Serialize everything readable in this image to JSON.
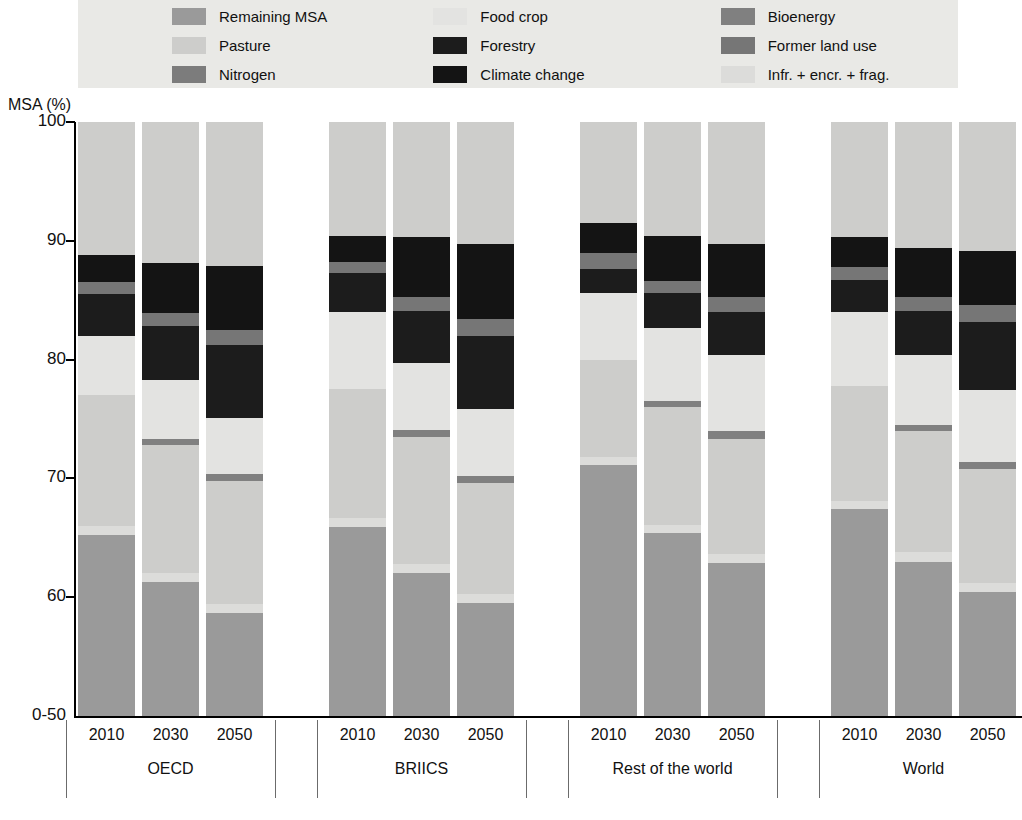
{
  "chart_data": {
    "type": "bar",
    "subtype": "stacked-bar-grouped",
    "title": "",
    "xlabel": "",
    "ylabel": "MSA (%)",
    "ylim": [
      50,
      100
    ],
    "yaxis_break_label": "0-50",
    "ytick_labels": [
      "100",
      "90",
      "80",
      "70",
      "60",
      "0-50"
    ],
    "ytick_values": [
      100,
      90,
      80,
      70,
      60,
      50
    ],
    "grid": false,
    "legend_position": "top",
    "legend": [
      {
        "key": "remaining_msa",
        "label": "Remaining MSA",
        "color": "#9a9a9a"
      },
      {
        "key": "food_crop",
        "label": "Food crop",
        "color": "#e3e3e1"
      },
      {
        "key": "bioenergy",
        "label": "Bioenergy",
        "color": "#808080"
      },
      {
        "key": "pasture",
        "label": "Pasture",
        "color": "#cdcdcb"
      },
      {
        "key": "forestry",
        "label": "Forestry",
        "color": "#1c1c1c"
      },
      {
        "key": "former_land_use",
        "label": "Former land use",
        "color": "#767676"
      },
      {
        "key": "nitrogen",
        "label": "Nitrogen",
        "color": "#7c7c7c"
      },
      {
        "key": "climate_change",
        "label": "Climate change",
        "color": "#141414"
      },
      {
        "key": "infr_encr_frag",
        "label": "Infr. + encr. + frag.",
        "color": "#dcdcda"
      }
    ],
    "series_order_bottom_to_top": [
      "remaining_msa",
      "infr_encr_frag",
      "nitrogen",
      "pasture",
      "bioenergy",
      "food_crop",
      "forestry",
      "former_land_use",
      "climate_change"
    ],
    "categories": [
      "OECD",
      "BRIICS",
      "Rest of the world",
      "World"
    ],
    "years": [
      "2010",
      "2030",
      "2050"
    ],
    "groups": [
      {
        "name": "OECD",
        "bars": [
          {
            "year": "2010",
            "top": 100.0,
            "segments": [
              {
                "key": "remaining_msa",
                "from": 50.0,
                "to": 65.2
              },
              {
                "key": "infr_encr_frag",
                "from": 65.2,
                "to": 66.0
              },
              {
                "key": "pasture",
                "from": 66.0,
                "to": 77.0
              },
              {
                "key": "food_crop",
                "from": 77.0,
                "to": 82.0
              },
              {
                "key": "forestry",
                "from": 82.0,
                "to": 85.5
              },
              {
                "key": "former_land_use",
                "from": 85.5,
                "to": 86.5
              },
              {
                "key": "climate_change",
                "from": 86.5,
                "to": 88.8
              },
              {
                "key": "remaining_top",
                "from": 88.8,
                "to": 100.0
              }
            ]
          },
          {
            "year": "2030",
            "top": 100.0,
            "segments": [
              {
                "key": "remaining_msa",
                "from": 50.0,
                "to": 61.3
              },
              {
                "key": "infr_encr_frag",
                "from": 61.3,
                "to": 62.0
              },
              {
                "key": "pasture",
                "from": 62.0,
                "to": 72.8
              },
              {
                "key": "bioenergy",
                "from": 72.8,
                "to": 73.3
              },
              {
                "key": "food_crop",
                "from": 73.3,
                "to": 78.3
              },
              {
                "key": "forestry",
                "from": 78.3,
                "to": 82.8
              },
              {
                "key": "former_land_use",
                "from": 82.8,
                "to": 83.9
              },
              {
                "key": "climate_change",
                "from": 83.9,
                "to": 88.1
              },
              {
                "key": "remaining_top",
                "from": 88.1,
                "to": 100.0
              }
            ]
          },
          {
            "year": "2050",
            "top": 100.0,
            "segments": [
              {
                "key": "remaining_msa",
                "from": 50.0,
                "to": 58.7
              },
              {
                "key": "infr_encr_frag",
                "from": 58.7,
                "to": 59.4
              },
              {
                "key": "pasture",
                "from": 59.4,
                "to": 69.8
              },
              {
                "key": "bioenergy",
                "from": 69.8,
                "to": 70.4
              },
              {
                "key": "food_crop",
                "from": 70.4,
                "to": 75.1
              },
              {
                "key": "forestry",
                "from": 75.1,
                "to": 81.2
              },
              {
                "key": "former_land_use",
                "from": 81.2,
                "to": 82.5
              },
              {
                "key": "climate_change",
                "from": 82.5,
                "to": 87.9
              },
              {
                "key": "remaining_top",
                "from": 87.9,
                "to": 100.0
              }
            ]
          }
        ]
      },
      {
        "name": "BRIICS",
        "bars": [
          {
            "year": "2010",
            "top": 100.0,
            "segments": [
              {
                "key": "remaining_msa",
                "from": 50.0,
                "to": 65.9
              },
              {
                "key": "infr_encr_frag",
                "from": 65.9,
                "to": 66.7
              },
              {
                "key": "pasture",
                "from": 66.7,
                "to": 77.5
              },
              {
                "key": "food_crop",
                "from": 77.5,
                "to": 84.0
              },
              {
                "key": "forestry",
                "from": 84.0,
                "to": 87.3
              },
              {
                "key": "former_land_use",
                "from": 87.3,
                "to": 88.2
              },
              {
                "key": "climate_change",
                "from": 88.2,
                "to": 90.4
              },
              {
                "key": "remaining_top",
                "from": 90.4,
                "to": 100.0
              }
            ]
          },
          {
            "year": "2030",
            "top": 100.0,
            "segments": [
              {
                "key": "remaining_msa",
                "from": 50.0,
                "to": 62.0
              },
              {
                "key": "infr_encr_frag",
                "from": 62.0,
                "to": 62.8
              },
              {
                "key": "pasture",
                "from": 62.8,
                "to": 73.5
              },
              {
                "key": "bioenergy",
                "from": 73.5,
                "to": 74.1
              },
              {
                "key": "food_crop",
                "from": 74.1,
                "to": 79.7
              },
              {
                "key": "forestry",
                "from": 79.7,
                "to": 84.1
              },
              {
                "key": "former_land_use",
                "from": 84.1,
                "to": 85.3
              },
              {
                "key": "climate_change",
                "from": 85.3,
                "to": 90.3
              },
              {
                "key": "remaining_top",
                "from": 90.3,
                "to": 100.0
              }
            ]
          },
          {
            "year": "2050",
            "top": 100.0,
            "segments": [
              {
                "key": "remaining_msa",
                "from": 50.0,
                "to": 59.5
              },
              {
                "key": "infr_encr_frag",
                "from": 59.5,
                "to": 60.3
              },
              {
                "key": "pasture",
                "from": 60.3,
                "to": 69.6
              },
              {
                "key": "bioenergy",
                "from": 69.6,
                "to": 70.2
              },
              {
                "key": "food_crop",
                "from": 70.2,
                "to": 75.8
              },
              {
                "key": "forestry",
                "from": 75.8,
                "to": 82.0
              },
              {
                "key": "former_land_use",
                "from": 82.0,
                "to": 83.4
              },
              {
                "key": "climate_change",
                "from": 83.4,
                "to": 89.7
              },
              {
                "key": "remaining_top",
                "from": 89.7,
                "to": 100.0
              }
            ]
          }
        ]
      },
      {
        "name": "Rest of the world",
        "bars": [
          {
            "year": "2010",
            "top": 100.0,
            "segments": [
              {
                "key": "remaining_msa",
                "from": 50.0,
                "to": 71.1
              },
              {
                "key": "infr_encr_frag",
                "from": 71.1,
                "to": 71.8
              },
              {
                "key": "pasture",
                "from": 71.8,
                "to": 80.0
              },
              {
                "key": "food_crop",
                "from": 80.0,
                "to": 85.6
              },
              {
                "key": "forestry",
                "from": 85.6,
                "to": 87.6
              },
              {
                "key": "former_land_use",
                "from": 87.6,
                "to": 89.0
              },
              {
                "key": "climate_change",
                "from": 89.0,
                "to": 91.5
              },
              {
                "key": "remaining_top",
                "from": 91.5,
                "to": 100.0
              }
            ]
          },
          {
            "year": "2030",
            "top": 100.0,
            "segments": [
              {
                "key": "remaining_msa",
                "from": 50.0,
                "to": 65.4
              },
              {
                "key": "infr_encr_frag",
                "from": 65.4,
                "to": 66.1
              },
              {
                "key": "pasture",
                "from": 66.1,
                "to": 76.0
              },
              {
                "key": "bioenergy",
                "from": 76.0,
                "to": 76.5
              },
              {
                "key": "food_crop",
                "from": 76.5,
                "to": 82.7
              },
              {
                "key": "forestry",
                "from": 82.7,
                "to": 85.6
              },
              {
                "key": "former_land_use",
                "from": 85.6,
                "to": 86.6
              },
              {
                "key": "climate_change",
                "from": 86.6,
                "to": 90.4
              },
              {
                "key": "remaining_top",
                "from": 90.4,
                "to": 100.0
              }
            ]
          },
          {
            "year": "2050",
            "top": 100.0,
            "segments": [
              {
                "key": "remaining_msa",
                "from": 50.0,
                "to": 62.9
              },
              {
                "key": "infr_encr_frag",
                "from": 62.9,
                "to": 63.6
              },
              {
                "key": "pasture",
                "from": 63.6,
                "to": 73.3
              },
              {
                "key": "bioenergy",
                "from": 73.3,
                "to": 74.0
              },
              {
                "key": "food_crop",
                "from": 74.0,
                "to": 80.4
              },
              {
                "key": "forestry",
                "from": 80.4,
                "to": 84.0
              },
              {
                "key": "former_land_use",
                "from": 84.0,
                "to": 85.3
              },
              {
                "key": "climate_change",
                "from": 85.3,
                "to": 89.7
              },
              {
                "key": "remaining_top",
                "from": 89.7,
                "to": 100.0
              }
            ]
          }
        ]
      },
      {
        "name": "World",
        "bars": [
          {
            "year": "2010",
            "top": 100.0,
            "segments": [
              {
                "key": "remaining_msa",
                "from": 50.0,
                "to": 67.4
              },
              {
                "key": "infr_encr_frag",
                "from": 67.4,
                "to": 68.1
              },
              {
                "key": "pasture",
                "from": 68.1,
                "to": 77.8
              },
              {
                "key": "food_crop",
                "from": 77.8,
                "to": 84.0
              },
              {
                "key": "forestry",
                "from": 84.0,
                "to": 86.7
              },
              {
                "key": "former_land_use",
                "from": 86.7,
                "to": 87.8
              },
              {
                "key": "climate_change",
                "from": 87.8,
                "to": 90.3
              },
              {
                "key": "remaining_top",
                "from": 90.3,
                "to": 100.0
              }
            ]
          },
          {
            "year": "2030",
            "top": 100.0,
            "segments": [
              {
                "key": "remaining_msa",
                "from": 50.0,
                "to": 63.0
              },
              {
                "key": "infr_encr_frag",
                "from": 63.0,
                "to": 63.8
              },
              {
                "key": "pasture",
                "from": 63.8,
                "to": 74.0
              },
              {
                "key": "bioenergy",
                "from": 74.0,
                "to": 74.5
              },
              {
                "key": "food_crop",
                "from": 74.5,
                "to": 80.4
              },
              {
                "key": "forestry",
                "from": 80.4,
                "to": 84.1
              },
              {
                "key": "former_land_use",
                "from": 84.1,
                "to": 85.3
              },
              {
                "key": "climate_change",
                "from": 85.3,
                "to": 89.4
              },
              {
                "key": "remaining_top",
                "from": 89.4,
                "to": 100.0
              }
            ]
          },
          {
            "year": "2050",
            "top": 100.0,
            "segments": [
              {
                "key": "remaining_msa",
                "from": 50.0,
                "to": 60.4
              },
              {
                "key": "infr_encr_frag",
                "from": 60.4,
                "to": 61.2
              },
              {
                "key": "pasture",
                "from": 61.2,
                "to": 70.8
              },
              {
                "key": "bioenergy",
                "from": 70.8,
                "to": 71.4
              },
              {
                "key": "food_crop",
                "from": 71.4,
                "to": 77.4
              },
              {
                "key": "forestry",
                "from": 77.4,
                "to": 83.2
              },
              {
                "key": "former_land_use",
                "from": 83.2,
                "to": 84.6
              },
              {
                "key": "climate_change",
                "from": 84.6,
                "to": 89.1
              },
              {
                "key": "remaining_top",
                "from": 89.1,
                "to": 100.0
              }
            ]
          }
        ]
      }
    ]
  },
  "colors": {
    "remaining_msa": "#9a9a9a",
    "food_crop": "#e3e3e1",
    "bioenergy": "#808080",
    "pasture": "#cdcdcb",
    "forestry": "#1c1c1c",
    "former_land_use": "#767676",
    "nitrogen": "#7c7c7c",
    "climate_change": "#141414",
    "infr_encr_frag": "#dcdcda",
    "remaining_top": "#cdcdcb",
    "legend_bg": "#e9e9e6",
    "axis": "#000000"
  }
}
